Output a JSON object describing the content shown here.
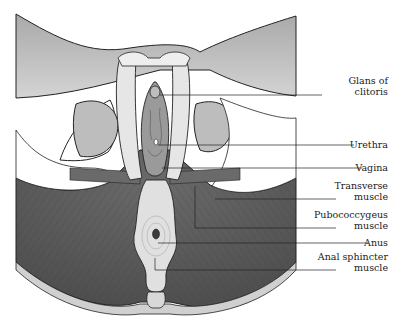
{
  "figure": {
    "type": "anatomical-illustration",
    "colors": {
      "line": "#222222",
      "muscle_dark": "#555555",
      "muscle_mid": "#7a7a7a",
      "skin": "#bdbdbd",
      "tissue_light": "#e6e6e6",
      "background": "#ffffff"
    }
  },
  "labels": [
    {
      "id": "glans",
      "line1": "Glans of",
      "line2": "clitoris",
      "line_y": 95,
      "target_x": 160,
      "text_top": 75
    },
    {
      "id": "urethra",
      "line1": "Urethra",
      "line2": "",
      "line_y": 145,
      "target_x": 158,
      "text_top": 139
    },
    {
      "id": "vagina",
      "line1": "Vagina",
      "line2": "",
      "line_y": 168,
      "target_x": 162,
      "text_top": 162
    },
    {
      "id": "transverse",
      "line1": "Transverse",
      "line2": "muscle",
      "line_y": 199,
      "target_x": 215,
      "text_top": 180
    },
    {
      "id": "pubococcygeus",
      "line1": "Pubococcygeus",
      "line2": "muscle",
      "line_y": 228,
      "target_x": 195,
      "text_top": 209
    },
    {
      "id": "anus",
      "line1": "Anus",
      "line2": "",
      "line_y": 243,
      "target_x": 158,
      "text_top": 237
    },
    {
      "id": "anal-sphincter",
      "line1": "Anal sphincter",
      "line2": "muscle",
      "line_y": 270,
      "target_x": 155,
      "text_top": 251
    }
  ]
}
